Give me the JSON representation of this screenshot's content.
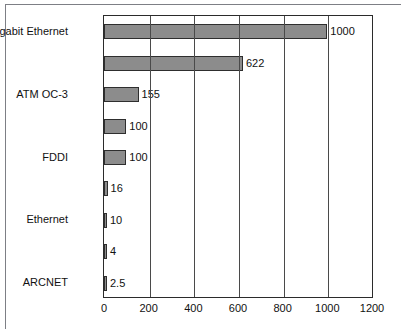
{
  "chart_data": {
    "type": "bar",
    "orientation": "horizontal",
    "title": "",
    "xlabel": "",
    "ylabel": "",
    "xlim": [
      0,
      1200
    ],
    "xticks": [
      0,
      200,
      400,
      600,
      800,
      1000,
      1200
    ],
    "xtick_labels": [
      "0",
      "200",
      "400",
      "600",
      "800",
      "1000",
      "1200"
    ],
    "grid": true,
    "grid_axis": "x",
    "legend": false,
    "bar_color": "#8c8c8c",
    "bar_edge_color": "#2e2e2e",
    "axis_color": "#2b2b2b",
    "categories": [
      "Gigabit Ethernet",
      "",
      "ATM OC-3",
      "",
      "FDDI",
      "",
      "Ethernet",
      "",
      "ARCNET"
    ],
    "values": [
      1000,
      622,
      155,
      100,
      100,
      16,
      10,
      4,
      2.5
    ],
    "value_labels": [
      "1000",
      "622",
      "155",
      "100",
      "100",
      "16",
      "10",
      "4",
      "2.5"
    ]
  },
  "bars": [
    {
      "label": "Gigabit Ethernet",
      "value": 1000,
      "value_label": "1000"
    },
    {
      "label": "",
      "value": 622,
      "value_label": "622"
    },
    {
      "label": "ATM OC-3",
      "value": 155,
      "value_label": "155"
    },
    {
      "label": "",
      "value": 100,
      "value_label": "100"
    },
    {
      "label": "FDDI",
      "value": 100,
      "value_label": "100"
    },
    {
      "label": "",
      "value": 16,
      "value_label": "16"
    },
    {
      "label": "Ethernet",
      "value": 10,
      "value_label": "10"
    },
    {
      "label": "",
      "value": 4,
      "value_label": "4"
    },
    {
      "label": "ARCNET",
      "value": 2.5,
      "value_label": "2.5"
    }
  ],
  "xaxis": {
    "ticks": [
      "0",
      "200",
      "400",
      "600",
      "800",
      "1000",
      "1200"
    ]
  }
}
